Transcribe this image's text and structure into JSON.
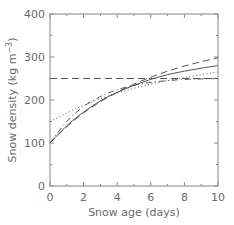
{
  "chart_data": {
    "type": "line",
    "title": "",
    "xlabel": "Snow age (days)",
    "ylabel": "Snow density (kg m⁻³)",
    "xlim": [
      0,
      10
    ],
    "ylim": [
      0,
      400
    ],
    "xticks": [
      0,
      2,
      4,
      6,
      8,
      10
    ],
    "xtick_labels": [
      "0",
      "2",
      "4",
      "6",
      "8",
      "10"
    ],
    "yticks": [
      0,
      100,
      200,
      300,
      400
    ],
    "ytick_labels": [
      "0",
      "100",
      "200",
      "300",
      "400"
    ],
    "grid": false,
    "legend": null,
    "x": [
      0,
      1,
      2,
      3,
      4,
      5,
      6,
      7,
      8,
      9,
      10
    ],
    "series": [
      {
        "name": "solid",
        "style": "solid",
        "values": [
          100,
          140,
          172,
          198,
          218,
          234,
          248,
          259,
          267,
          274,
          280
        ]
      },
      {
        "name": "long-dash",
        "style": "dashed",
        "values": [
          100,
          138,
          170,
          196,
          218,
          237,
          253,
          267,
          279,
          289,
          298
        ]
      },
      {
        "name": "dotted",
        "style": "dotted",
        "values": [
          150,
          170,
          188,
          203,
          216,
          227,
          237,
          245,
          252,
          259,
          265
        ]
      },
      {
        "name": "dash-dot",
        "style": "dashdot",
        "values": [
          100,
          150,
          185,
          208,
          224,
          234,
          241,
          245,
          248,
          249,
          250
        ]
      },
      {
        "name": "constant",
        "style": "dashed-flat",
        "values": [
          250,
          250,
          250,
          250,
          250,
          250,
          250,
          250,
          250,
          250,
          250
        ]
      }
    ]
  },
  "colors": {
    "line": "#555555",
    "axis": "#888888",
    "text": "#6a6a6a"
  }
}
